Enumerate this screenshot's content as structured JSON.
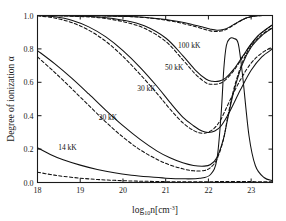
{
  "figure": {
    "name": "degree-of-ionization-vs-density",
    "background": "#ffffff",
    "frame_color": "#1a1a1a"
  },
  "axes": {
    "x": {
      "label_main": "log",
      "label_sub": "10",
      "label_rest": "n[cm",
      "label_sup": "-3",
      "label_close": "]",
      "ticks": [
        "18",
        "19",
        "20",
        "21",
        "22",
        "23"
      ],
      "tick_values": [
        18,
        19,
        20,
        21,
        22,
        23
      ],
      "range": [
        18,
        23.5
      ]
    },
    "y": {
      "label": "Degree of ionization α",
      "ticks": [
        "0.0",
        "0.2",
        "0.4",
        "0.6",
        "0.8",
        "1.0"
      ],
      "tick_values": [
        0.0,
        0.2,
        0.4,
        0.6,
        0.8,
        1.0
      ],
      "range": [
        0.0,
        1.0
      ]
    }
  },
  "annotations": [
    {
      "text": "100 kK",
      "x": 21.55,
      "y": 0.805
    },
    {
      "text": "50 kK",
      "x": 21.2,
      "y": 0.672
    },
    {
      "text": "30 kK",
      "x": 20.55,
      "y": 0.545
    },
    {
      "text": "20 kK",
      "x": 19.65,
      "y": 0.375
    },
    {
      "text": "14 kK",
      "x": 18.7,
      "y": 0.192
    }
  ],
  "chart_data": {
    "type": "line",
    "title": "",
    "xlabel": "log10 n [cm^-3]",
    "ylabel": "Degree of ionization alpha",
    "xlim": [
      18,
      23.5
    ],
    "ylim": [
      0.0,
      1.0
    ],
    "grid": false,
    "legend": "inline-annotations",
    "linestyles": [
      "solid",
      "dashed"
    ],
    "series": [
      {
        "name": "100 kK solid",
        "temperature_kK": 100,
        "style": "solid",
        "x": [
          18.0,
          18.5,
          19.0,
          19.5,
          20.0,
          20.5,
          21.0,
          21.3,
          21.6,
          21.9,
          22.05,
          22.2,
          22.35,
          22.5,
          22.7,
          22.9,
          23.1,
          23.3,
          23.5
        ],
        "y": [
          1.0,
          1.0,
          0.999,
          0.998,
          0.996,
          0.99,
          0.976,
          0.964,
          0.948,
          0.928,
          0.918,
          0.912,
          0.916,
          0.932,
          0.962,
          0.986,
          0.997,
          1.0,
          1.0
        ]
      },
      {
        "name": "100 kK dashed",
        "temperature_kK": 100,
        "style": "dashed",
        "x": [
          18.0,
          18.5,
          19.0,
          19.5,
          20.0,
          20.5,
          21.0,
          21.3,
          21.6,
          21.9,
          22.05,
          22.2,
          22.35,
          22.5,
          22.7,
          22.9,
          23.1,
          23.3,
          23.5
        ],
        "y": [
          1.0,
          1.0,
          0.999,
          0.998,
          0.995,
          0.988,
          0.972,
          0.958,
          0.94,
          0.918,
          0.908,
          0.904,
          0.91,
          0.928,
          0.96,
          0.985,
          0.997,
          1.0,
          1.0
        ]
      },
      {
        "name": "50 kK solid",
        "temperature_kK": 50,
        "style": "solid",
        "x": [
          18.0,
          18.5,
          19.0,
          19.5,
          20.0,
          20.5,
          21.0,
          21.4,
          21.7,
          21.95,
          22.1,
          22.25,
          22.4,
          22.6,
          22.8,
          23.0,
          23.2,
          23.5
        ],
        "y": [
          1.0,
          0.999,
          0.996,
          0.99,
          0.972,
          0.938,
          0.865,
          0.76,
          0.672,
          0.618,
          0.606,
          0.607,
          0.625,
          0.68,
          0.755,
          0.83,
          0.888,
          0.945
        ]
      },
      {
        "name": "50 kK dashed",
        "temperature_kK": 50,
        "style": "dashed",
        "x": [
          18.0,
          18.5,
          19.0,
          19.5,
          20.0,
          20.5,
          21.0,
          21.4,
          21.7,
          21.95,
          22.1,
          22.25,
          22.4,
          22.6,
          22.8,
          23.0,
          23.2,
          23.5
        ],
        "y": [
          1.0,
          0.998,
          0.994,
          0.985,
          0.963,
          0.924,
          0.845,
          0.735,
          0.648,
          0.596,
          0.588,
          0.592,
          0.614,
          0.672,
          0.75,
          0.827,
          0.886,
          0.944
        ]
      },
      {
        "name": "30 kK solid",
        "temperature_kK": 30,
        "style": "solid",
        "x": [
          18.0,
          18.4,
          18.8,
          19.2,
          19.6,
          20.0,
          20.4,
          20.8,
          21.1,
          21.4,
          21.65,
          21.85,
          22.0,
          22.15,
          22.3,
          22.5,
          22.75,
          23.0,
          23.25,
          23.5
        ],
        "y": [
          1.0,
          0.992,
          0.972,
          0.932,
          0.872,
          0.79,
          0.69,
          0.575,
          0.48,
          0.392,
          0.34,
          0.308,
          0.3,
          0.308,
          0.34,
          0.425,
          0.555,
          0.672,
          0.752,
          0.8
        ]
      },
      {
        "name": "30 kK dashed",
        "temperature_kK": 30,
        "style": "dashed",
        "x": [
          18.0,
          18.4,
          18.8,
          19.2,
          19.6,
          20.0,
          20.4,
          20.8,
          21.1,
          21.4,
          21.65,
          21.85,
          22.0,
          22.15,
          22.3,
          22.5,
          22.75,
          23.0,
          23.25,
          23.5
        ],
        "y": [
          0.998,
          0.985,
          0.958,
          0.912,
          0.845,
          0.755,
          0.648,
          0.532,
          0.44,
          0.358,
          0.312,
          0.295,
          0.302,
          0.328,
          0.382,
          0.49,
          0.615,
          0.715,
          0.775,
          0.812
        ]
      },
      {
        "name": "20 kK solid",
        "temperature_kK": 20,
        "style": "solid",
        "x": [
          18.0,
          18.4,
          18.8,
          19.2,
          19.6,
          20.0,
          20.4,
          20.8,
          21.1,
          21.4,
          21.65,
          21.9,
          22.05,
          22.2,
          22.35,
          22.45,
          22.6,
          22.8,
          23.0,
          23.25,
          23.5
        ],
        "y": [
          0.79,
          0.712,
          0.625,
          0.53,
          0.432,
          0.34,
          0.258,
          0.188,
          0.148,
          0.118,
          0.102,
          0.098,
          0.108,
          0.15,
          0.26,
          0.38,
          0.55,
          0.71,
          0.81,
          0.88,
          0.925
        ]
      },
      {
        "name": "20 kK dashed",
        "temperature_kK": 20,
        "style": "dashed",
        "x": [
          18.0,
          18.4,
          18.8,
          19.2,
          19.6,
          20.0,
          20.4,
          20.8,
          21.1,
          21.4,
          21.65,
          21.9,
          22.05,
          22.2,
          22.35,
          22.45,
          22.6,
          22.8,
          23.0,
          23.25,
          23.5
        ],
        "y": [
          0.752,
          0.66,
          0.562,
          0.462,
          0.362,
          0.272,
          0.196,
          0.138,
          0.105,
          0.082,
          0.07,
          0.072,
          0.09,
          0.14,
          0.255,
          0.39,
          0.565,
          0.722,
          0.818,
          0.885,
          0.928
        ]
      },
      {
        "name": "14 kK solid",
        "temperature_kK": 14,
        "style": "solid",
        "x": [
          18.0,
          18.3,
          18.6,
          19.0,
          19.4,
          19.8,
          20.2,
          20.6,
          21.0,
          21.4,
          21.8,
          22.05,
          22.2,
          22.3,
          22.36,
          22.42,
          22.5,
          22.6,
          22.7,
          22.8,
          22.95,
          23.1,
          23.3,
          23.5
        ],
        "y": [
          0.208,
          0.168,
          0.136,
          0.104,
          0.078,
          0.058,
          0.044,
          0.034,
          0.026,
          0.022,
          0.025,
          0.048,
          0.14,
          0.42,
          0.68,
          0.82,
          0.862,
          0.862,
          0.83,
          0.64,
          0.28,
          0.1,
          0.03,
          0.012
        ]
      },
      {
        "name": "14 kK dashed",
        "temperature_kK": 14,
        "style": "dashed",
        "x": [
          18.0,
          18.3,
          18.6,
          19.0,
          19.4,
          19.8,
          20.2,
          20.6,
          21.0,
          21.4,
          21.8,
          22.1,
          22.4,
          22.8,
          23.1,
          23.5
        ],
        "y": [
          0.062,
          0.048,
          0.037,
          0.026,
          0.018,
          0.013,
          0.009,
          0.007,
          0.005,
          0.004,
          0.004,
          0.005,
          0.006,
          0.006,
          0.005,
          0.004
        ]
      }
    ]
  }
}
